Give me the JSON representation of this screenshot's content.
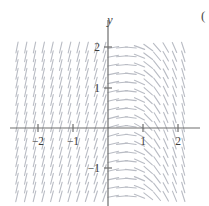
{
  "figure": {
    "corner_label": "(",
    "background_color": "#ffffff",
    "axis_color": "#6e6e6e",
    "segment_color": "#b9bcc4"
  },
  "chart_data": {
    "type": "scatter",
    "plot_kind": "direction-field",
    "title": "",
    "xlabel": "",
    "ylabel": "y",
    "axis_labels": {
      "x_axis_name": "",
      "y_axis_name": "y"
    },
    "xlim": [
      -2.75,
      2.35
    ],
    "ylim": [
      -2.35,
      2.4
    ],
    "grid": false,
    "legend": null,
    "xticks": [
      -2,
      -1,
      1,
      2
    ],
    "xticklabels": [
      "−2",
      "−1",
      "1",
      "2"
    ],
    "yticks": [
      -1,
      1,
      2
    ],
    "yticklabels": [
      "−1",
      "1",
      "2"
    ],
    "origin_px": [
      108,
      128
    ],
    "pixels_per_unit": 35,
    "field": {
      "description": "Slope field of a first-order ODE. Left half (x<0): steep positive slopes, nearly vertical, leaning right. Right half (x>0): shallow slopes forming nested arcs that flatten near the positive x-axis and steepen negatively toward the right edge.",
      "x_samples": [
        -2.6,
        -2.35,
        -2.1,
        -1.85,
        -1.6,
        -1.35,
        -1.1,
        -0.85,
        -0.6,
        -0.35,
        -0.1,
        0.15,
        0.4,
        0.65,
        0.9,
        1.15,
        1.4,
        1.65,
        1.9,
        2.15
      ],
      "y_samples": [
        -2.2,
        -1.95,
        -1.7,
        -1.45,
        -1.2,
        -0.95,
        -0.7,
        -0.45,
        -0.2,
        0.05,
        0.3,
        0.55,
        0.8,
        1.05,
        1.3,
        1.55,
        1.8,
        2.05,
        2.3
      ],
      "segment_length_px": 11,
      "line_width_px": 1.1
    }
  },
  "ticks": {
    "x": [
      {
        "value": -2,
        "label": "−2",
        "px": 38
      },
      {
        "value": -1,
        "label": "−1",
        "px": 73
      },
      {
        "value": 1,
        "label": "1",
        "px": 143
      },
      {
        "value": 2,
        "label": "2",
        "px": 178
      }
    ],
    "y": [
      {
        "value": 2,
        "label": "2",
        "px": 47
      },
      {
        "value": 1,
        "label": "1",
        "px": 88
      },
      {
        "value": -1,
        "label": "−1",
        "px": 168
      }
    ]
  }
}
